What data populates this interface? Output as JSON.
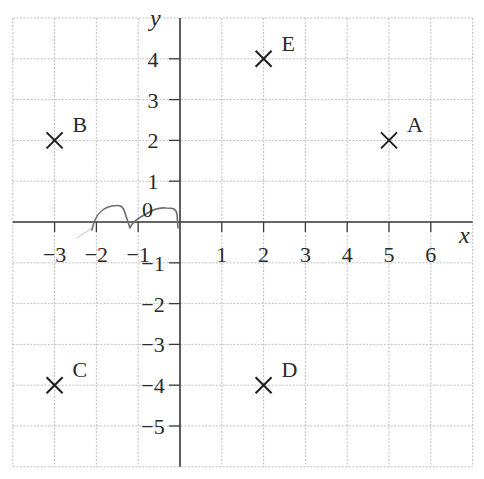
{
  "chart_data": {
    "type": "scatter",
    "title": "",
    "xlabel": "x",
    "ylabel": "y",
    "xlim": [
      -4,
      7
    ],
    "ylim": [
      -6,
      5
    ],
    "grid": true,
    "grid_style": "dashed light grey, 1 unit spacing",
    "x_ticks": [
      -3,
      -2,
      -1,
      1,
      2,
      3,
      4,
      5,
      6
    ],
    "x_tick_labels": [
      "−3",
      "−2",
      "−1",
      "1",
      "2",
      "3",
      "4",
      "5",
      "6"
    ],
    "y_ticks": [
      -5,
      -4,
      -3,
      -2,
      -1,
      1,
      2,
      3,
      4
    ],
    "y_tick_labels": [
      "−5",
      "−4",
      "−3",
      "−2",
      "−1",
      "1",
      "2",
      "3",
      "4"
    ],
    "origin_label": "0",
    "marker": "x",
    "points": [
      {
        "label": "A",
        "x": 5,
        "y": 2
      },
      {
        "label": "B",
        "x": -3,
        "y": 2
      },
      {
        "label": "C",
        "x": -3,
        "y": -4
      },
      {
        "label": "D",
        "x": 2,
        "y": -4
      },
      {
        "label": "E",
        "x": 2,
        "y": 4
      }
    ],
    "annotations": [
      {
        "type": "handwritten-scribble",
        "description": "pencil squiggle drawn just above the negative x-axis between x≈-2.4 and x≈0"
      }
    ]
  },
  "colors": {
    "grid": "#b8b8b8",
    "axis": "#3a3a3a",
    "marker": "#1e1e1e",
    "text": "#2a2a2a",
    "scribble": "#6e6e6e"
  }
}
